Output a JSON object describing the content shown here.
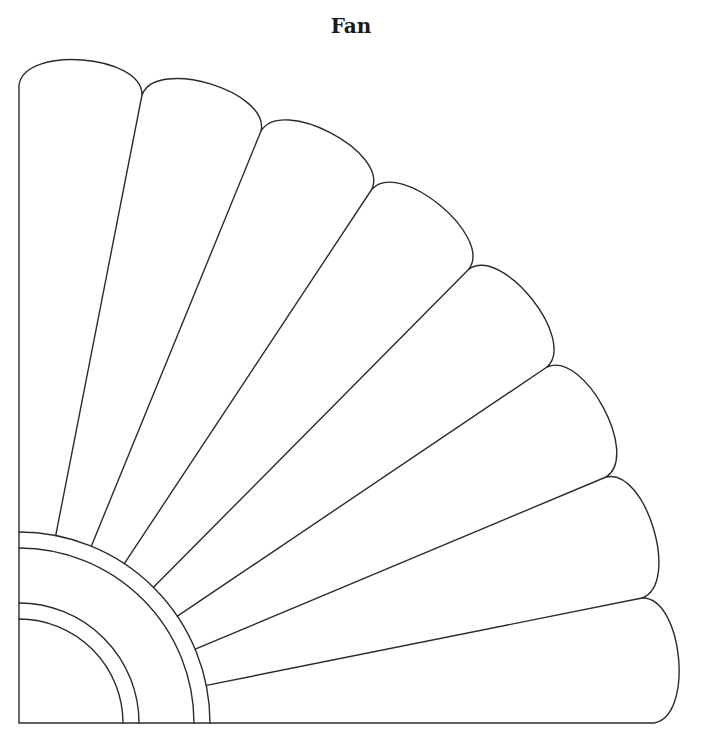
{
  "title": "Fan",
  "diagram": {
    "type": "quilt-pattern-template",
    "stroke_color": "#2b2b2b",
    "background": "#ffffff",
    "origin": [
      19,
      723
    ],
    "ring_radii": [
      104,
      120,
      175,
      191
    ],
    "blade_count": 8,
    "outline_points": [
      [
        19,
        85
      ],
      [
        142,
        95
      ],
      [
        261,
        131
      ],
      [
        372,
        189
      ],
      [
        469,
        269
      ],
      [
        547,
        367
      ],
      [
        606,
        477
      ],
      [
        642,
        598
      ],
      [
        654,
        723
      ]
    ],
    "scallop_bulge": 0.62
  }
}
